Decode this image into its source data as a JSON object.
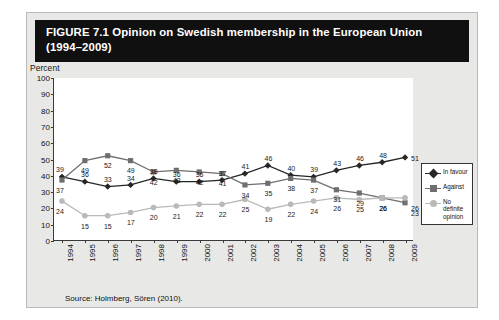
{
  "figure": {
    "title": "FIGURE 7.1  Opinion on Swedish membership in the European Union (1994–2009)",
    "source": "Source: Holmberg, Sören (2010).",
    "background_color": "#e8e8e6",
    "title_bar_color": "#101010",
    "plot_background": "#ffffff"
  },
  "legend": {
    "position": "right",
    "entries": [
      {
        "label": "In favour",
        "color": "#262626",
        "marker": "diamond"
      },
      {
        "label": "Against",
        "color": "#6f6f6f",
        "marker": "square"
      },
      {
        "label": "No definite opinion",
        "color": "#b9b9b9",
        "marker": "circle"
      }
    ]
  },
  "chart_data": {
    "type": "line",
    "title": "FIGURE 7.1  Opinion on Swedish membership in the European Union (1994–2009)",
    "xlabel": "",
    "ylabel": "Percent",
    "ylim": [
      0,
      100
    ],
    "ytick_step": 10,
    "yticks": [
      0,
      10,
      20,
      30,
      40,
      50,
      60,
      70,
      80,
      90,
      100
    ],
    "grid": false,
    "legend_position": "right",
    "categories": [
      "1994",
      "1995",
      "1996",
      "1997",
      "1998",
      "1999",
      "2000",
      "2001",
      "2002",
      "2003",
      "2004",
      "2005",
      "2006",
      "2007",
      "2008",
      "2009"
    ],
    "series": [
      {
        "name": "In favour",
        "color": "#262626",
        "marker": "diamond",
        "values": [
          39,
          36,
          33,
          34,
          38,
          36,
          36,
          37,
          41,
          46,
          40,
          39,
          43,
          46,
          48,
          51
        ]
      },
      {
        "name": "Against",
        "color": "#6f6f6f",
        "marker": "square",
        "values": [
          37,
          49,
          52,
          49,
          42,
          43,
          42,
          41,
          34,
          35,
          38,
          37,
          31,
          29,
          26,
          23
        ]
      },
      {
        "name": "No definite opinion",
        "color": "#b9b9b9",
        "marker": "circle",
        "values": [
          24,
          15,
          15,
          17,
          20,
          21,
          22,
          22,
          25,
          19,
          22,
          24,
          26,
          25,
          26,
          26
        ]
      }
    ]
  }
}
